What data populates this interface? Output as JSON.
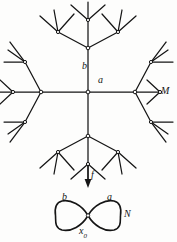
{
  "figure": {
    "caption_absent": true,
    "background_color": "#fdfdfc",
    "ink_color": "#151515",
    "width": 177,
    "height": 242
  },
  "cover_space": {
    "name": "universal-cover-tree",
    "description_label": "M",
    "label_M": "M",
    "label_a": "a",
    "label_b": "b",
    "center_node": {
      "x": 88,
      "y": 92
    },
    "valence": 4,
    "levels": 3,
    "node_style": "small open circle",
    "edges": [
      {
        "from": [
          88,
          92
        ],
        "to": [
          88,
          48
        ],
        "label": "b"
      },
      {
        "from": [
          88,
          92
        ],
        "to": [
          132,
          92
        ],
        "label": "a"
      },
      {
        "from": [
          88,
          92
        ],
        "to": [
          44,
          92
        ],
        "label": "a"
      },
      {
        "from": [
          88,
          92
        ],
        "to": [
          88,
          136
        ],
        "label": "b"
      }
    ]
  },
  "base_space": {
    "name": "wedge-of-two-circles",
    "description_label": "N",
    "label_N": "N",
    "loop_left_label": "b",
    "loop_right_label": "a",
    "basepoint_label": "x",
    "basepoint_subscript": "0",
    "basepoint": {
      "x": 88,
      "y": 215
    },
    "left_loop_extent_x": [
      55,
      88
    ],
    "right_loop_extent_x": [
      88,
      122
    ],
    "loop_extent_y": [
      198,
      233
    ]
  },
  "map": {
    "name": "covering-map",
    "label_f": "f",
    "arrow_direction": "down",
    "arrow_from": {
      "x": 88,
      "y": 166
    },
    "arrow_to": {
      "x": 88,
      "y": 186
    }
  },
  "labels": {
    "tree_b": "b",
    "tree_a": "a",
    "tree_M": "M",
    "map_f": "f",
    "loop_b": "b",
    "loop_a": "a",
    "loop_N": "N",
    "basepoint_x": "x",
    "basepoint_0": "0"
  }
}
